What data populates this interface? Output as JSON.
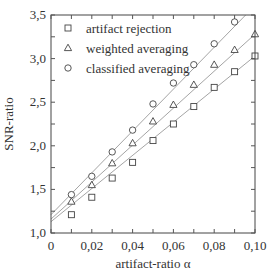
{
  "chart_data": {
    "type": "scatter",
    "title": "",
    "xlabel": "artifact-ratio α",
    "ylabel": "SNR-ratio",
    "xlim": [
      0,
      0.1
    ],
    "ylim": [
      1.0,
      3.5
    ],
    "x_ticks": [
      0,
      0.02,
      0.04,
      0.06,
      0.08,
      0.1
    ],
    "x_tick_labels": [
      "0",
      "0,02",
      "0,04",
      "0,06",
      "0,08",
      "0,10"
    ],
    "y_ticks": [
      1.0,
      1.5,
      2.0,
      2.5,
      3.0,
      3.5
    ],
    "y_tick_labels": [
      "1,0",
      "1,5",
      "2,0",
      "2,5",
      "3,0",
      "3,5"
    ],
    "grid": false,
    "legend_position": "upper left",
    "series": [
      {
        "name": "artifact rejection",
        "marker": "square",
        "x": [
          0.01,
          0.02,
          0.03,
          0.04,
          0.05,
          0.06,
          0.07,
          0.08,
          0.09,
          0.1
        ],
        "values": [
          1.21,
          1.41,
          1.63,
          1.81,
          2.06,
          2.25,
          2.45,
          2.67,
          2.85,
          3.03
        ],
        "fit_line": {
          "intercept": 1.13,
          "slope": 19.0
        }
      },
      {
        "name": "weighted averaging",
        "marker": "triangle",
        "x": [
          0.01,
          0.02,
          0.03,
          0.04,
          0.05,
          0.06,
          0.07,
          0.08,
          0.09,
          0.1
        ],
        "values": [
          1.36,
          1.55,
          1.8,
          2.03,
          2.28,
          2.47,
          2.7,
          2.93,
          3.1,
          3.28
        ],
        "fit_line": {
          "intercept": 1.16,
          "slope": 21.2
        }
      },
      {
        "name": "classified averaging",
        "marker": "circle",
        "x": [
          0.01,
          0.02,
          0.03,
          0.04,
          0.05,
          0.06,
          0.07,
          0.08,
          0.09
        ],
        "values": [
          1.44,
          1.65,
          1.93,
          2.18,
          2.48,
          2.72,
          2.93,
          3.17,
          3.42
        ],
        "fit_line": {
          "intercept": 1.21,
          "slope": 24.0
        }
      }
    ]
  }
}
